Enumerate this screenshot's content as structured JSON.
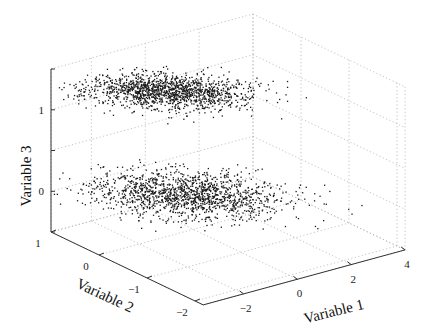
{
  "chart_data": {
    "type": "scatter",
    "subtype": "scatter3d",
    "title": "",
    "axes": {
      "x": {
        "label": "Variable 1",
        "range": [
          -3.5,
          4
        ],
        "ticks": [
          -2,
          0,
          2,
          4
        ],
        "tick_labels": [
          "−2",
          "0",
          "2",
          "4"
        ]
      },
      "y": {
        "label": "Variable 2",
        "range": [
          -2.17,
          1
        ],
        "ticks": [
          1,
          0,
          -1,
          -2
        ],
        "tick_labels": [
          "1",
          "0",
          "−1",
          "−2"
        ]
      },
      "z": {
        "label": "Variable 3",
        "range": [
          -0.5,
          1.5
        ],
        "ticks": [
          0,
          1
        ],
        "tick_labels": [
          "0",
          "1"
        ],
        "grid_ticks": [
          -0.5,
          0,
          0.5,
          1,
          1.5
        ]
      }
    },
    "grid": true,
    "legend": null,
    "series": [
      {
        "name": "Cluster (Variable 3 ≈ 1)",
        "n_points": 1500,
        "center": [
          -0.5,
          0.3,
          1.15
        ],
        "spread": [
          1.1,
          0.45,
          0.08
        ],
        "color": "#1a1a1a"
      },
      {
        "name": "Cluster (Variable 3 ≈ 0)",
        "n_points": 1500,
        "center": [
          -0.3,
          0.0,
          -0.05
        ],
        "spread": [
          1.2,
          0.55,
          0.12
        ],
        "color": "#1a1a1a"
      }
    ]
  },
  "labels": {
    "x_axis": "Variable 1",
    "y_axis": "Variable 2",
    "z_axis": "Variable 3"
  }
}
